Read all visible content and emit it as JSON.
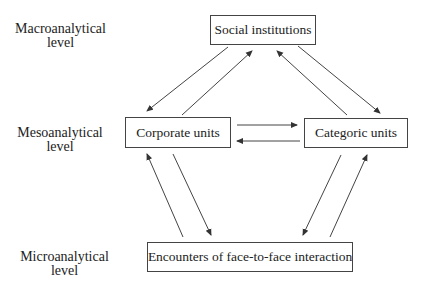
{
  "levels": {
    "macro": {
      "line1": "Macroanalytical",
      "line2": "level"
    },
    "meso": {
      "line1": "Mesoanalytical",
      "line2": "level"
    },
    "micro": {
      "line1": "Microanalytical",
      "line2": "level"
    }
  },
  "nodes": {
    "social": "Social institutions",
    "corporate": "Corporate units",
    "categoric": "Categoric units",
    "encounters": "Encounters of face-to-face interaction"
  },
  "edges": [
    {
      "from": "social",
      "to": "corporate"
    },
    {
      "from": "corporate",
      "to": "social"
    },
    {
      "from": "social",
      "to": "categoric"
    },
    {
      "from": "categoric",
      "to": "social"
    },
    {
      "from": "corporate",
      "to": "categoric"
    },
    {
      "from": "categoric",
      "to": "corporate"
    },
    {
      "from": "corporate",
      "to": "encounters"
    },
    {
      "from": "encounters",
      "to": "corporate"
    },
    {
      "from": "categoric",
      "to": "encounters"
    },
    {
      "from": "encounters",
      "to": "categoric"
    }
  ]
}
